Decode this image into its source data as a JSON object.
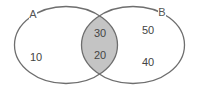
{
  "diagram": {
    "type": "venn",
    "sets": [
      {
        "id": "A",
        "label": "A",
        "only_value": "10"
      },
      {
        "id": "B",
        "label": "B",
        "only_value_top": "50",
        "only_value_bottom": "40"
      }
    ],
    "intersection": {
      "values": [
        "30",
        "20"
      ]
    },
    "colors": {
      "outline": "#6e6e6e",
      "intersection_fill": "#c4c4c4",
      "text": "#444444",
      "background": "#ffffff"
    }
  },
  "labels": {
    "set_a": "A",
    "set_b": "B",
    "a_only": "10",
    "intersection_top": "30",
    "intersection_bottom": "20",
    "b_only_top": "50",
    "b_only_bottom": "40"
  }
}
